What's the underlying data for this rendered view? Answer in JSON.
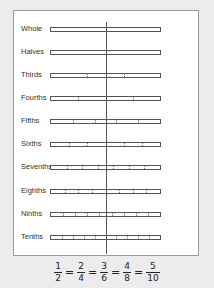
{
  "diagram": {
    "type": "fraction_strips",
    "rows": [
      {
        "label": "Whole",
        "parts": 1
      },
      {
        "label": "Halves",
        "parts": 2
      },
      {
        "label": "Thirds",
        "parts": 3
      },
      {
        "label": "Fourths",
        "parts": 4
      },
      {
        "label": "Fifths",
        "parts": 5
      },
      {
        "label": "Sixths",
        "parts": 6
      },
      {
        "label": "Sevenths",
        "parts": 7
      },
      {
        "label": "Eighths",
        "parts": 8
      },
      {
        "label": "Ninths",
        "parts": 9
      },
      {
        "label": "Tenths",
        "parts": 10
      }
    ],
    "marker_line": "one-half",
    "equation": {
      "fractions": [
        {
          "num": "1",
          "den": "2"
        },
        {
          "num": "2",
          "den": "4"
        },
        {
          "num": "3",
          "den": "6"
        },
        {
          "num": "4",
          "den": "8"
        },
        {
          "num": "5",
          "den": "10"
        }
      ],
      "separator": "="
    }
  }
}
